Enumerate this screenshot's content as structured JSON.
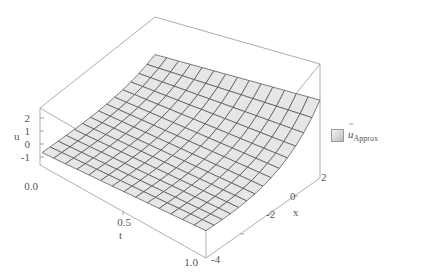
{
  "chart_data": {
    "type": "surface3d",
    "title": "",
    "axes": {
      "t": {
        "label": "t",
        "ticks": [
          "0.0",
          "0.5",
          "1.0"
        ],
        "range": [
          0,
          1
        ]
      },
      "x": {
        "label": "x",
        "ticks": [
          "-4",
          "-2",
          "0",
          "2"
        ],
        "range": [
          -4,
          2
        ]
      },
      "u": {
        "label": "u",
        "ticks": [
          "-1",
          "0",
          "1",
          "2"
        ],
        "range": [
          -1.5,
          2.5
        ]
      }
    },
    "legend": [
      {
        "name": "ũ_Approx",
        "base": "u",
        "subscript": "Approx",
        "accent": "~"
      }
    ],
    "mesh": {
      "t_lines": 15,
      "x_lines": 15
    },
    "surface_color": "#e6e6e6",
    "mesh_color": "#4a4a4a",
    "box_color": "#8a8a8a"
  },
  "labels": {
    "u_axis": "u",
    "t_axis": "t",
    "x_axis": "x",
    "u_ticks": [
      "2",
      "1",
      "0",
      "-1"
    ],
    "t_ticks": [
      "0.0",
      "0.5",
      "1.0"
    ],
    "x_ticks": [
      "2",
      "0",
      "-2",
      "-4"
    ],
    "legend_base": "u",
    "legend_accent": "~",
    "legend_sub": "Approx"
  }
}
